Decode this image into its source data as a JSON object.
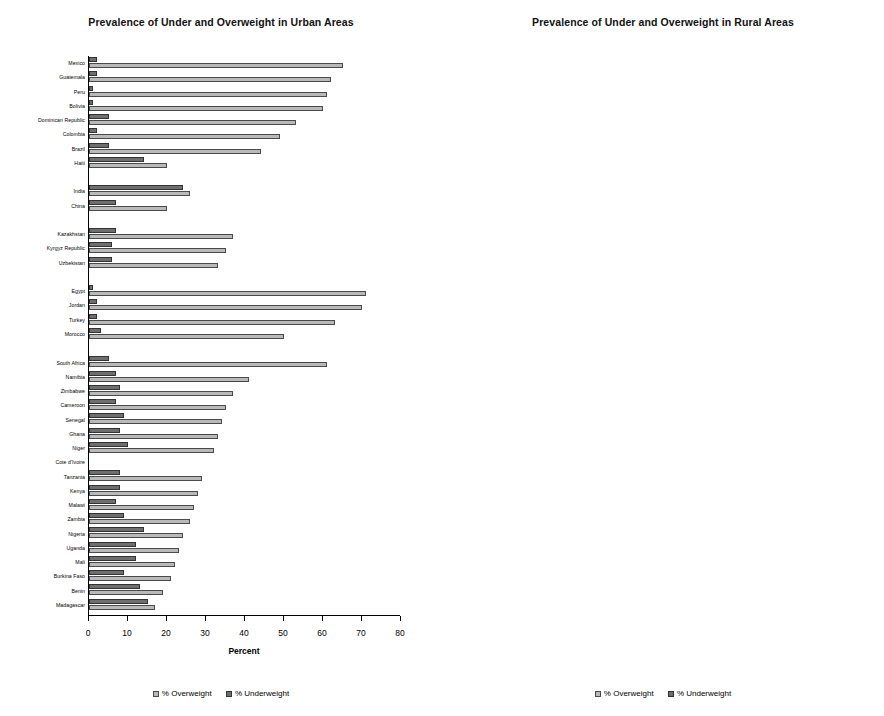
{
  "legend": {
    "overweight_label": "% Overweight",
    "underweight_label": "% Underweight",
    "overweight_color": "#b9b9b9",
    "underweight_color": "#6e6e6e"
  },
  "panels": [
    {
      "key": "urban",
      "title": "Prevalence of Under and Overweight in Urban Areas",
      "xlabel": "Percent"
    },
    {
      "key": "rural",
      "title": "Prevalence of Under and Overweight in Rural Areas",
      "xlabel": "Percent"
    }
  ],
  "chart_data": [
    {
      "type": "bar",
      "orientation": "horizontal",
      "title": "Prevalence of Under and Overweight in Urban Areas",
      "xlabel": "Percent",
      "ylabel": "",
      "xlim": [
        0,
        80
      ],
      "xticks": [
        0,
        10,
        20,
        30,
        40,
        50,
        60,
        70,
        80
      ],
      "grid": false,
      "legend_position": "bottom",
      "categories": [
        "Mexico",
        "Guatemala",
        "Peru",
        "Bolivia",
        "Dominican Republic",
        "Colombia",
        "Brazil",
        "Haiti",
        "",
        "India",
        "China",
        "",
        "Kazakhstan",
        "Kyrgyz Republic",
        "Uzbekistan",
        "",
        "Egypt",
        "Jordan",
        "Turkey",
        "Morocco",
        "",
        "South Africa",
        "Namibia",
        "Zimbabwe",
        "Cameroon",
        "Senegal",
        "Ghana",
        "Niger",
        "Cote d'Ivoire",
        "Tanzania",
        "Kenya",
        "Malawi",
        "Zambia",
        "Nigeria",
        "Uganda",
        "Mali",
        "Burkina Faso",
        "Benin",
        "Madagascar"
      ],
      "series": [
        {
          "name": "% Overweight",
          "values": [
            65,
            62,
            61,
            60,
            53,
            49,
            44,
            20,
            null,
            26,
            20,
            null,
            37,
            35,
            33,
            null,
            71,
            70,
            63,
            50,
            null,
            61,
            41,
            37,
            35,
            34,
            33,
            32,
            0,
            29,
            28,
            27,
            26,
            24,
            23,
            22,
            21,
            19,
            17
          ]
        },
        {
          "name": "% Underweight",
          "values": [
            2,
            2,
            1,
            1,
            5,
            2,
            5,
            14,
            null,
            24,
            7,
            null,
            7,
            6,
            6,
            null,
            1,
            2,
            2,
            3,
            null,
            5,
            7,
            8,
            7,
            9,
            8,
            10,
            0,
            8,
            8,
            7,
            9,
            14,
            12,
            12,
            9,
            13,
            15
          ]
        }
      ]
    },
    {
      "type": "bar",
      "orientation": "horizontal",
      "title": "Prevalence of Under and Overweight in Rural Areas",
      "xlabel": "Percent",
      "ylabel": "",
      "xlim": [
        0,
        70
      ],
      "xticks": [
        0,
        10,
        20,
        30,
        40,
        50,
        60,
        70
      ],
      "grid": false,
      "legend_position": "bottom",
      "categories": [
        "Mexico",
        "Guatemala",
        "Peru",
        "Bolivia",
        "Dominican Republic",
        "Colombia",
        "Brazil",
        "Haiti",
        "",
        "India",
        "China",
        "",
        "Kazakhstan",
        "Kyrgyz Republic",
        "Uzbekistan",
        "",
        "Egypt",
        "Jordan",
        "Turkey",
        "Morocco",
        "",
        "South Africa",
        "Namibia",
        "Zimbabwe",
        "Cameroon",
        "Senegal",
        "Ghana",
        "Niger",
        "Cote d'Ivoire",
        "Tanzania",
        "Kenya",
        "Malawi",
        "Zambia",
        "Nigeria",
        "Uganda",
        "Mali",
        "Burkina Faso",
        "Benin",
        "Madagascar"
      ],
      "series": [
        {
          "name": "% Overweight",
          "values": [
            58,
            44,
            43,
            48,
            39,
            50,
            33,
            21,
            null,
            49,
            15,
            null,
            36,
            34,
            27,
            null,
            46,
            64,
            66,
            28,
            null,
            56,
            16,
            24,
            20,
            14,
            13,
            19,
            12,
            11,
            12,
            10,
            14,
            23,
            11,
            15,
            15,
            15,
            22
          ]
        },
        {
          "name": "% Underweight",
          "values": [
            3,
            2,
            1,
            1,
            6,
            2,
            10,
            9,
            null,
            6,
            3,
            null,
            6,
            6,
            8,
            null,
            2,
            2,
            3,
            5,
            null,
            6,
            15,
            5,
            12,
            11,
            12,
            4,
            8,
            10,
            9,
            9,
            10,
            15,
            9,
            13,
            14,
            13,
            4
          ]
        }
      ]
    }
  ]
}
